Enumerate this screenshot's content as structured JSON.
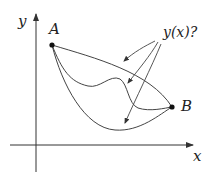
{
  "diagram": {
    "type": "brachistochrone-style curve sketch",
    "axes": {
      "x_label": "x",
      "y_label": "y"
    },
    "points": {
      "A": {
        "label": "A"
      },
      "B": {
        "label": "B"
      }
    },
    "question_label": "y(x)?",
    "curves": [
      {
        "name": "upper-curve",
        "description": "nearly straight, gently sagging line from A to B"
      },
      {
        "name": "wavy-curve",
        "description": "dips, rises, then dips again before reaching B"
      },
      {
        "name": "lower-curve",
        "description": "deep U-shaped curve from A to B"
      }
    ],
    "colors": {
      "stroke": "#333333",
      "background": "#ffffff"
    }
  }
}
